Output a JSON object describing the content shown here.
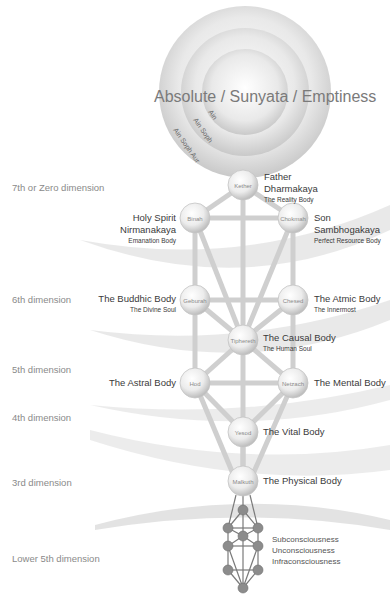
{
  "title": "Absolute / Sunyata / Emptiness",
  "ain_rings": [
    "Ain",
    "Ain Soph",
    "Ain Soph Aur"
  ],
  "dimensions": [
    {
      "label": "7th or Zero dimension"
    },
    {
      "label": "6th dimension"
    },
    {
      "label": "5th dimension"
    },
    {
      "label": "4th dimension"
    },
    {
      "label": "3rd dimension"
    },
    {
      "label": "Lower 5th dimension"
    }
  ],
  "sephiroth": [
    {
      "name": "Kether",
      "title": "Father",
      "subtitle": "Dharmakaya",
      "note": "The Reality Body"
    },
    {
      "name": "Binah",
      "title": "Holy Spirit",
      "subtitle": "Nirmanakaya",
      "note": "Emanation Body"
    },
    {
      "name": "Chokmah",
      "title": "Son",
      "subtitle": "Sambhogakaya",
      "note": "Perfect Resource Body"
    },
    {
      "name": "Geburah",
      "title": "The Buddhic Body",
      "note": "The Divine Soul"
    },
    {
      "name": "Chesed",
      "title": "The Atmic Body",
      "note": "The Innermost"
    },
    {
      "name": "Tiphereth",
      "title": "The Causal Body",
      "note": "The Human Soul"
    },
    {
      "name": "Hod",
      "title": "The Astral Body"
    },
    {
      "name": "Netzach",
      "title": "The Mental Body"
    },
    {
      "name": "Yesod",
      "title": "The Vital Body"
    },
    {
      "name": "Malkuth",
      "title": "The Physical Body"
    }
  ],
  "lower": {
    "lines": [
      "Subconsciousness",
      "Unconsciousness",
      "Infraconsciousness"
    ]
  },
  "colors": {
    "background": "#ffffff",
    "sphere": "#d8d8d8",
    "path": "#c8c8c8",
    "text": "#3a3a3a",
    "dim_text": "#8a8a8a",
    "qliphoth_node": "#8c8c8c"
  }
}
